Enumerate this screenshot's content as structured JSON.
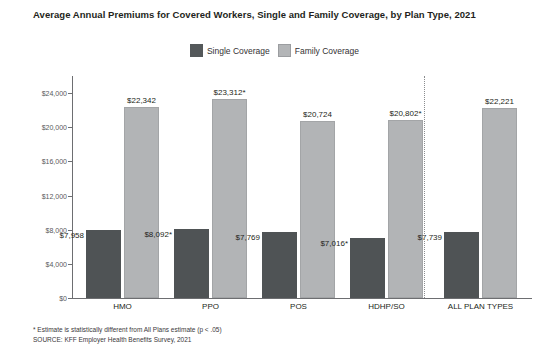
{
  "chart_data": {
    "type": "bar",
    "title": "Average Annual Premiums for Covered Workers, Single and Family Coverage, by Plan Type, 2021",
    "xlabel": "",
    "ylabel": "",
    "ylim": [
      0,
      26000
    ],
    "grid": false,
    "legend_position": "top-center",
    "categories": [
      "HMO",
      "PPO",
      "POS",
      "HDHP/SO",
      "ALL PLAN TYPES"
    ],
    "ytick_labels": [
      "$0",
      "$4,000",
      "$8,000",
      "$12,000",
      "$16,000",
      "$20,000",
      "$24,000"
    ],
    "ytick_values": [
      0,
      4000,
      8000,
      12000,
      16000,
      20000,
      24000
    ],
    "series": [
      {
        "name": "Single Coverage",
        "color": "#4f5355",
        "values": [
          7958,
          8092,
          7769,
          7016,
          7739
        ],
        "labels": [
          "$7,958",
          "$8,092*",
          "$7,769",
          "$7,016*",
          "$7,739"
        ]
      },
      {
        "name": "Family Coverage",
        "color": "#b2b4b6",
        "values": [
          22342,
          23312,
          20724,
          20802,
          22221
        ],
        "labels": [
          "$22,342",
          "$23,312*",
          "$20,724",
          "$20,802*",
          "$22,221"
        ]
      }
    ],
    "annotations": [
      "* Estimate is statistically different from All Plans estimate (p < .05)",
      "SOURCE: KFF Employer Health Benefits Survey, 2021"
    ]
  },
  "legend": {
    "items": [
      {
        "label": "Single Coverage",
        "swatch": "single"
      },
      {
        "label": "Family Coverage",
        "swatch": "family"
      }
    ]
  },
  "footnotes": {
    "estimate_note": "* Estimate is statistically different from All Plans estimate (p < .05)",
    "source_note": "SOURCE: KFF Employer Health Benefits Survey, 2021"
  }
}
